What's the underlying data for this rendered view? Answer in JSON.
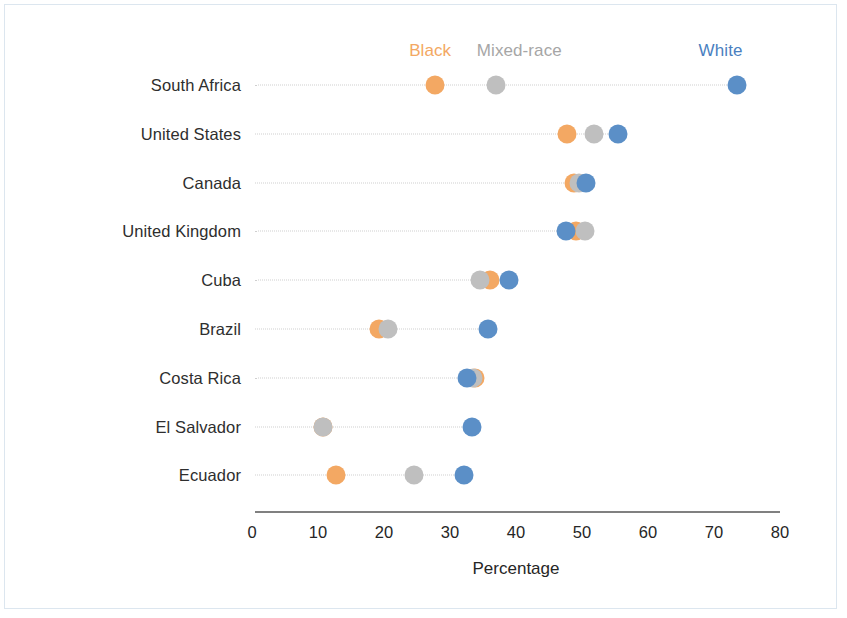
{
  "chart_data": {
    "type": "scatter",
    "subtype": "dot-plot",
    "title": "",
    "xlabel": "Percentage",
    "ylabel": "",
    "xlim": [
      0,
      80
    ],
    "xticks": [
      0,
      10,
      20,
      30,
      40,
      50,
      60,
      70,
      80
    ],
    "grid": false,
    "legend_position": "top",
    "categories": [
      "South Africa",
      "United States",
      "Canada",
      "United Kingdom",
      "Cuba",
      "Brazil",
      "Costa Rica",
      "El Salvador",
      "Ecuador"
    ],
    "series": [
      {
        "name": "Black",
        "color": "#F3A863",
        "values": [
          27.7,
          47.7,
          48.8,
          49.1,
          36.1,
          19.2,
          33.8,
          10.8,
          12.7
        ]
      },
      {
        "name": "Mixed-race",
        "color": "#BFBFBF",
        "values": [
          37.0,
          51.8,
          49.5,
          50.5,
          34.5,
          20.6,
          33.5,
          10.8,
          24.5
        ]
      },
      {
        "name": "White",
        "color": "#5B8FC7",
        "values": [
          73.5,
          55.5,
          50.6,
          47.6,
          38.9,
          35.8,
          32.5,
          33.3,
          32.1
        ]
      }
    ]
  },
  "legend": {
    "items": [
      {
        "label": "Black",
        "color": "#F3A863",
        "x_value": 27.0
      },
      {
        "label": "Mixed-race",
        "color": "#A6A6A6",
        "x_value": 40.5
      },
      {
        "label": "White",
        "color": "#4A7FBF",
        "x_value": 71.0
      }
    ]
  },
  "axis": {
    "title": "Percentage"
  }
}
